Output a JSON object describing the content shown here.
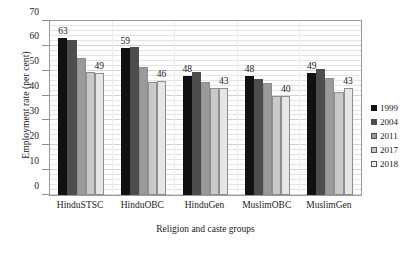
{
  "chart_data": {
    "type": "bar",
    "title": "",
    "xlabel": "Religion and caste groups",
    "ylabel": "Employment rate (per cent)",
    "ylim": [
      0,
      70
    ],
    "yticks": [
      0,
      10,
      20,
      30,
      40,
      50,
      60,
      70
    ],
    "grid": true,
    "legend_position": "right",
    "categories": [
      "HinduSTSC",
      "HinduOBC",
      "HinduGen",
      "MuslimOBC",
      "MuslimGen"
    ],
    "series": [
      {
        "name": "1999",
        "color": "#111111",
        "values": [
          63,
          59,
          48,
          48,
          49
        ]
      },
      {
        "name": "2004",
        "color": "#4d4d4d",
        "values": [
          62.5,
          59.5,
          49.5,
          46.5,
          50.5
        ]
      },
      {
        "name": "2011",
        "color": "#9a9a9a",
        "values": [
          55,
          51.5,
          45.5,
          45,
          47
        ]
      },
      {
        "name": "2017",
        "color": "#c9c9c9",
        "values": [
          49.5,
          45.5,
          43,
          40,
          41.5
        ]
      },
      {
        "name": "2018",
        "color": "#e6e6e6",
        "values": [
          49,
          46,
          43,
          40,
          43
        ]
      }
    ],
    "data_labels": [
      {
        "category": "HinduSTSC",
        "series": "1999",
        "text": "63"
      },
      {
        "category": "HinduSTSC",
        "series": "2018",
        "text": "49"
      },
      {
        "category": "HinduOBC",
        "series": "1999",
        "text": "59"
      },
      {
        "category": "HinduOBC",
        "series": "2018",
        "text": "46"
      },
      {
        "category": "HinduGen",
        "series": "1999",
        "text": "48"
      },
      {
        "category": "HinduGen",
        "series": "2018",
        "text": "43"
      },
      {
        "category": "MuslimOBC",
        "series": "1999",
        "text": "48"
      },
      {
        "category": "MuslimOBC",
        "series": "2018",
        "text": "40"
      },
      {
        "category": "MuslimGen",
        "series": "1999",
        "text": "49"
      },
      {
        "category": "MuslimGen",
        "series": "2018",
        "text": "43"
      }
    ]
  },
  "legend": {
    "items": [
      {
        "label": "1999"
      },
      {
        "label": "2004"
      },
      {
        "label": "2011"
      },
      {
        "label": "2017"
      },
      {
        "label": "2018"
      }
    ]
  }
}
